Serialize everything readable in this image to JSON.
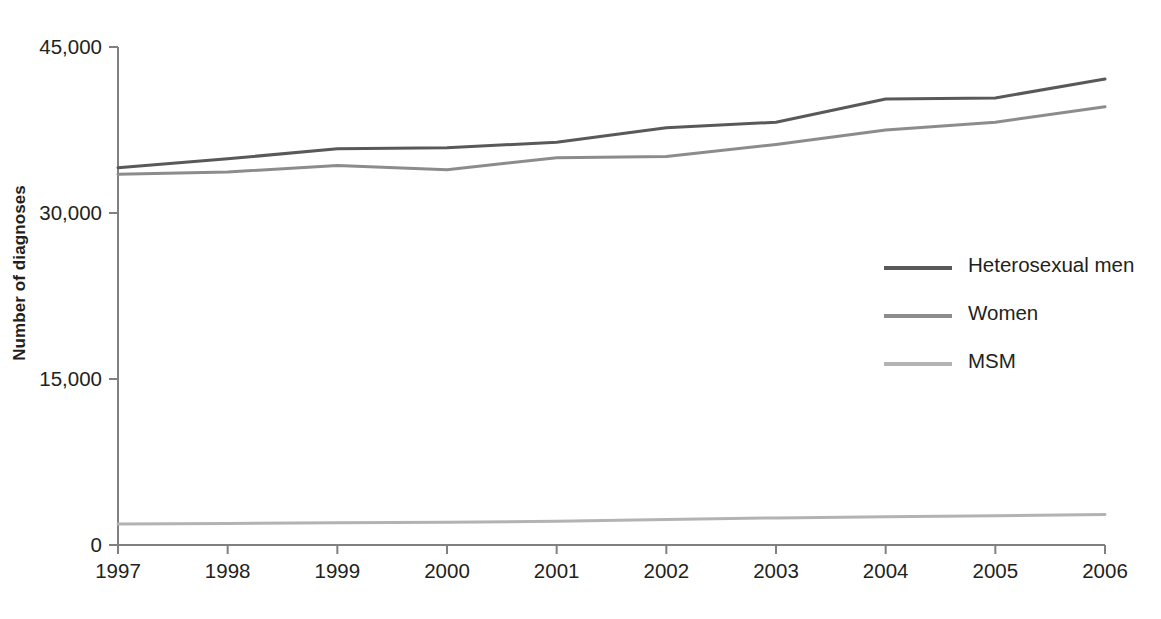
{
  "chart_data": {
    "type": "line",
    "title": "",
    "xlabel": "",
    "ylabel": "Number of diagnoses",
    "x": [
      1997,
      1998,
      1999,
      2000,
      2001,
      2002,
      2003,
      2004,
      2005,
      2006
    ],
    "categories": [
      "1997",
      "1998",
      "1999",
      "2000",
      "2001",
      "2002",
      "2003",
      "2004",
      "2005",
      "2006"
    ],
    "xlim": [
      1997,
      2006
    ],
    "ylim": [
      0,
      45000
    ],
    "yticks": [
      0,
      15000,
      30000,
      45000
    ],
    "ytick_labels": [
      "0",
      "15,000",
      "30,000",
      "45,000"
    ],
    "grid": false,
    "legend_position": "center-right",
    "series": [
      {
        "name": "Heterosexual men",
        "color": "#595959",
        "values": [
          34100,
          34900,
          35800,
          35900,
          36400,
          37700,
          38200,
          40300,
          40400,
          42100
        ]
      },
      {
        "name": "Women",
        "color": "#8c8c8c",
        "values": [
          33500,
          33700,
          34300,
          33900,
          35000,
          35100,
          36200,
          37500,
          38200,
          39600
        ]
      },
      {
        "name": "MSM",
        "color": "#b3b3b3",
        "values": [
          1900,
          1950,
          2000,
          2050,
          2150,
          2300,
          2450,
          2550,
          2650,
          2750
        ]
      }
    ]
  },
  "legend": {
    "items": [
      {
        "label": "Heterosexual men",
        "color": "#595959"
      },
      {
        "label": "Women",
        "color": "#8c8c8c"
      },
      {
        "label": "MSM",
        "color": "#b3b3b3"
      }
    ]
  },
  "axis": {
    "color": "#808080"
  }
}
